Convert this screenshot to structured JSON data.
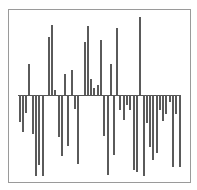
{
  "chart_data": {
    "type": "bar",
    "title": "",
    "xlabel": "",
    "ylabel": "",
    "grid": false,
    "legend": null,
    "baseline_y_px": 94.7,
    "bar_x_px": [
      19.7,
      23,
      26.3,
      29.3,
      32.7,
      36,
      39.3,
      42.7,
      48.7,
      51.7,
      55.3,
      58.7,
      62,
      65,
      68.3,
      71.7,
      75,
      78.3,
      84.7,
      88,
      91,
      94.3,
      97.7,
      100.7,
      104.3,
      107.7,
      110.7,
      114,
      117,
      120.3,
      123.7,
      127,
      130.3,
      133.7,
      137,
      140,
      143.7,
      147,
      150,
      153.3,
      156.7,
      160,
      163.3,
      166.3,
      169.7,
      173,
      176.3,
      179.7
    ],
    "values": [
      -27,
      -37,
      -18,
      31,
      -39,
      -81,
      -70,
      -81,
      58,
      70,
      5,
      -42,
      -61,
      21,
      -51,
      25,
      -14,
      -69,
      53,
      69,
      16,
      7,
      10,
      55,
      -41,
      -80,
      31,
      -60,
      67,
      -15,
      -25,
      -10,
      -15,
      -75,
      -77,
      78,
      -81,
      -28,
      -52,
      -65,
      -58,
      -15,
      -26,
      -19,
      -7,
      -72,
      -19,
      -72
    ]
  }
}
